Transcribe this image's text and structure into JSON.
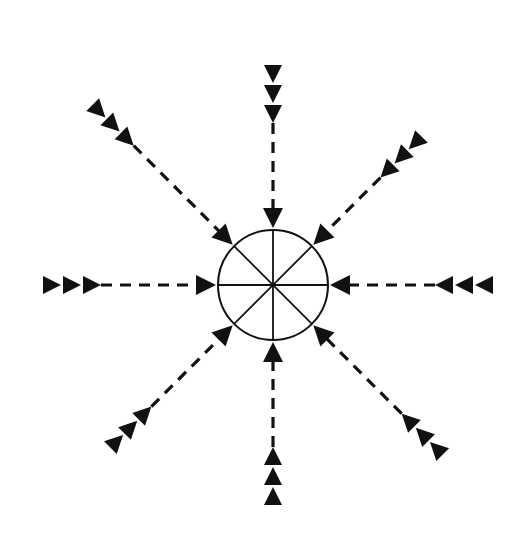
{
  "diagram": {
    "type": "convergence-diagram",
    "center": {
      "x": 273,
      "y": 285,
      "radius": 55,
      "sectors": 8
    },
    "colors": {
      "ink": "#111111",
      "background": "#ffffff"
    },
    "arrows": [
      {
        "direction": "north",
        "angle": -90,
        "marker_count": 3,
        "marker_symbol": "triangle"
      },
      {
        "direction": "north-east",
        "angle": -45,
        "marker_count": 3,
        "marker_symbol": "triangle"
      },
      {
        "direction": "east",
        "angle": 0,
        "marker_count": 3,
        "marker_symbol": "triangle"
      },
      {
        "direction": "south-east",
        "angle": 45,
        "marker_count": 3,
        "marker_symbol": "triangle"
      },
      {
        "direction": "south",
        "angle": 90,
        "marker_count": 3,
        "marker_symbol": "triangle"
      },
      {
        "direction": "south-west",
        "angle": 135,
        "marker_count": 3,
        "marker_symbol": "triangle"
      },
      {
        "direction": "west",
        "angle": 180,
        "marker_count": 3,
        "marker_symbol": "triangle"
      },
      {
        "direction": "north-west",
        "angle": -135,
        "marker_count": 3,
        "marker_symbol": "triangle"
      }
    ]
  }
}
